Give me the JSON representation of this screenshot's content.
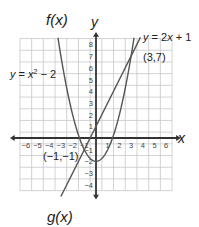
{
  "chart_data": {
    "type": "line",
    "title": "",
    "xlabel": "x",
    "ylabel": "y",
    "xlim": [
      -6.5,
      6.5
    ],
    "ylim": [
      -4.5,
      8.5
    ],
    "grid": true,
    "x_ticks": [
      -6,
      -5,
      -4,
      -3,
      -2,
      -1,
      1,
      2,
      3,
      4,
      5,
      6
    ],
    "y_ticks": [
      -4,
      -3,
      -2,
      -1,
      1,
      2,
      3,
      4,
      5,
      6,
      7,
      8
    ],
    "series": [
      {
        "name": "f(x)",
        "equation": "y = x² − 2",
        "type": "parabola"
      },
      {
        "name": "g(x)",
        "equation": "y = 2x + 1",
        "type": "line"
      }
    ],
    "annotations": [
      {
        "label": "(3,7)",
        "x": 3,
        "y": 7
      },
      {
        "label": "(−1,−1)",
        "x": -1,
        "y": -1
      }
    ]
  },
  "labels": {
    "f_name": "f(x)",
    "g_name": "g(x)",
    "f_eq_prefix": "y = x",
    "f_eq_exp": "2",
    "f_eq_suffix": " − 2",
    "g_eq": "y = 2x + 1",
    "pt1": "(3,7)",
    "pt2": "(−1,−1)",
    "x_axis": "x",
    "y_axis": "y"
  },
  "colors": {
    "curve": "#555555",
    "grid": "#c8c8c8",
    "axis": "#333333"
  }
}
